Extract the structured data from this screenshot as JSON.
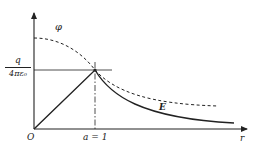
{
  "figure": {
    "axes": {
      "x_label": "r",
      "origin_label": "O",
      "x_tick_label": "a = 1",
      "y_tick_label": {
        "numerator": "q",
        "denominator": "4πε₀"
      }
    },
    "curves": {
      "potential_label": "φ",
      "field_label": "E"
    },
    "colors": {
      "stroke": "#222222",
      "background": "#ffffff"
    }
  }
}
